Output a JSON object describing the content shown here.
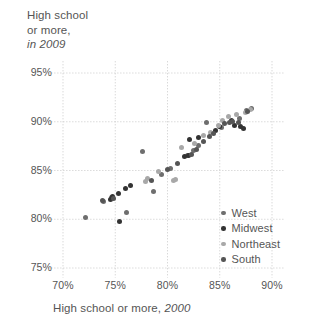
{
  "chart_data": {
    "type": "scatter",
    "title": "",
    "ylabel_lines": [
      "High school",
      "or more,",
      "in 2009"
    ],
    "ylabel_italic_part": "in 2009",
    "xlabel": "High school or more, 2000",
    "xlabel_italic_part": "2000",
    "xlim": [
      68.0,
      91.5
    ],
    "ylim": [
      73.5,
      96.5
    ],
    "xticks": [
      "70%",
      "75%",
      "80%",
      "85%",
      "90%"
    ],
    "xtick_values": [
      70,
      75,
      80,
      85,
      90
    ],
    "yticks": [
      "95%",
      "90%",
      "85%",
      "80%",
      "75%"
    ],
    "ytick_values": [
      95,
      90,
      85,
      80,
      75
    ],
    "grid": true,
    "grid_style": "dotted",
    "legend_position": "inside-bottom-right",
    "colors": {
      "West": "#6e6e6e",
      "Midwest": "#333333",
      "Northeast": "#a8a8a8",
      "South": "#555555",
      "grid": "#c9c9c9",
      "text": "#555555",
      "background": "#ffffff"
    },
    "series": [
      {
        "name": "West",
        "color": "#6e6e6e",
        "points": [
          [
            72.2,
            80.2
          ],
          [
            73.9,
            81.8
          ],
          [
            74.6,
            82.2
          ],
          [
            76.1,
            80.7
          ],
          [
            77.6,
            87.0
          ],
          [
            78.7,
            82.8
          ],
          [
            79.4,
            84.6
          ],
          [
            80.3,
            85.2
          ],
          [
            81.9,
            86.5
          ],
          [
            82.5,
            87.1
          ],
          [
            83.0,
            87.6
          ],
          [
            83.7,
            89.9
          ],
          [
            85.2,
            89.4
          ],
          [
            86.9,
            90.3
          ],
          [
            87.6,
            91.2
          ],
          [
            88.0,
            91.4
          ]
        ]
      },
      {
        "name": "Midwest",
        "color": "#333333",
        "points": [
          [
            75.4,
            79.8
          ],
          [
            74.5,
            82.0
          ],
          [
            74.7,
            82.3
          ],
          [
            75.3,
            82.6
          ],
          [
            76.0,
            83.2
          ],
          [
            76.5,
            83.5
          ],
          [
            81.6,
            86.4
          ],
          [
            82.0,
            86.5
          ],
          [
            82.1,
            88.2
          ],
          [
            83.0,
            88.4
          ],
          [
            84.6,
            89.1
          ],
          [
            85.0,
            89.5
          ],
          [
            86.1,
            90.1
          ],
          [
            86.4,
            89.6
          ],
          [
            87.0,
            89.5
          ],
          [
            87.3,
            89.3
          ]
        ]
      },
      {
        "name": "Northeast",
        "color": "#a8a8a8",
        "points": [
          [
            77.9,
            83.9
          ],
          [
            78.1,
            84.2
          ],
          [
            79.1,
            84.9
          ],
          [
            80.6,
            84.0
          ],
          [
            80.8,
            84.1
          ],
          [
            81.3,
            87.4
          ],
          [
            82.6,
            87.8
          ],
          [
            83.4,
            88.6
          ],
          [
            84.1,
            88.9
          ],
          [
            84.9,
            89.6
          ],
          [
            85.3,
            90.1
          ],
          [
            85.8,
            90.5
          ],
          [
            86.6,
            90.7
          ],
          [
            87.5,
            91.0
          ],
          [
            87.9,
            91.3
          ]
        ]
      },
      {
        "name": "South",
        "color": "#555555",
        "points": [
          [
            73.8,
            81.9
          ],
          [
            74.8,
            82.1
          ],
          [
            78.5,
            84.0
          ],
          [
            80.0,
            85.1
          ],
          [
            81.0,
            85.7
          ],
          [
            82.3,
            86.6
          ],
          [
            82.8,
            87.2
          ],
          [
            83.4,
            88.0
          ],
          [
            84.0,
            88.5
          ],
          [
            84.4,
            88.8
          ],
          [
            85.5,
            89.8
          ],
          [
            85.9,
            89.9
          ],
          [
            86.2,
            90.0
          ],
          [
            86.8,
            89.9
          ],
          [
            87.7,
            91.1
          ]
        ]
      }
    ],
    "legend": [
      {
        "label": "West",
        "color": "#6e6e6e"
      },
      {
        "label": "Midwest",
        "color": "#333333"
      },
      {
        "label": "Northeast",
        "color": "#a8a8a8"
      },
      {
        "label": "South",
        "color": "#555555"
      }
    ]
  }
}
